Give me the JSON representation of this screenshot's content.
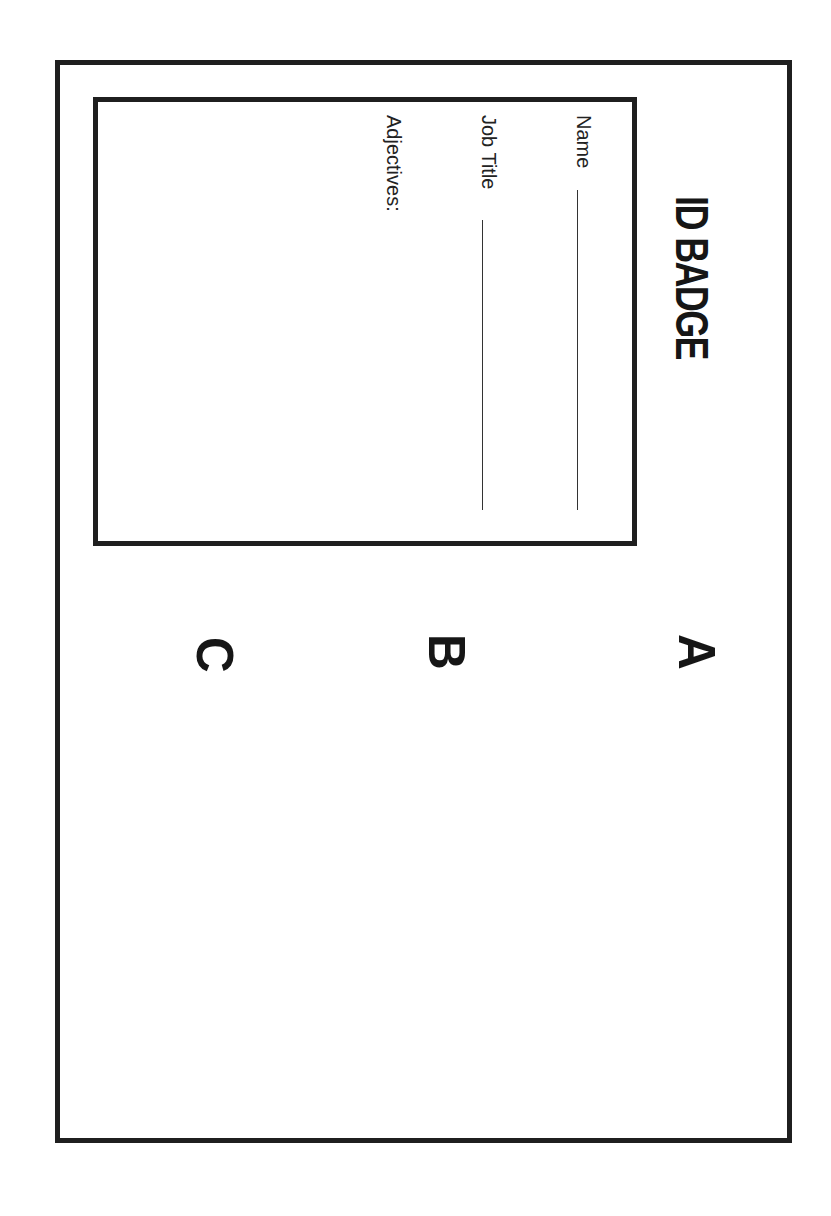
{
  "badge": {
    "title": "ID BADGE",
    "fields": {
      "name_label": "Name",
      "job_title_label": "Job Title",
      "adjectives_label": "Adjectives:"
    },
    "sections": [
      {
        "letter": "A"
      },
      {
        "letter": "B"
      },
      {
        "letter": "C"
      }
    ]
  },
  "colors": {
    "ink": "#1f1f1f",
    "paper": "#ffffff"
  },
  "orientation": "rotated-90-clockwise"
}
